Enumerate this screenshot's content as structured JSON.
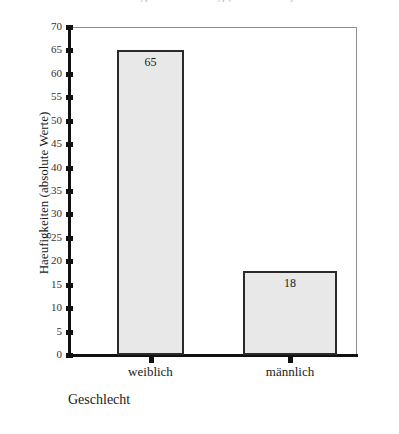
{
  "chart_data": {
    "type": "bar",
    "title": "",
    "xlabel": "Geschlecht",
    "ylabel": "Haeufigkeiten (absolute Werte)",
    "categories": [
      "weiblich",
      "männlich"
    ],
    "values": [
      65,
      18
    ],
    "value_labels": [
      "65",
      "18"
    ],
    "ylim": [
      0,
      70
    ],
    "ytick_step": 5,
    "yticks": [
      0,
      5,
      10,
      15,
      20,
      25,
      30,
      35,
      40,
      45,
      50,
      55,
      60,
      65,
      70
    ],
    "ytick_labels": [
      "0",
      "5",
      "10",
      "15",
      "20",
      "25",
      "30",
      "35",
      "40",
      "45",
      "50",
      "55",
      "60",
      "65",
      "70"
    ],
    "grid": false,
    "legend": false,
    "legend_position": "none",
    "bar_fill_color": "#e8e8e8",
    "bar_border_color": "#2a2a2a",
    "axis_color": "#111111",
    "frame_color": "#8e8e8e",
    "background_color": "#ffffff"
  },
  "figure": {
    "cropped_title_remnant": "Haeufigkeitsverteilung (Geschlecht)"
  }
}
